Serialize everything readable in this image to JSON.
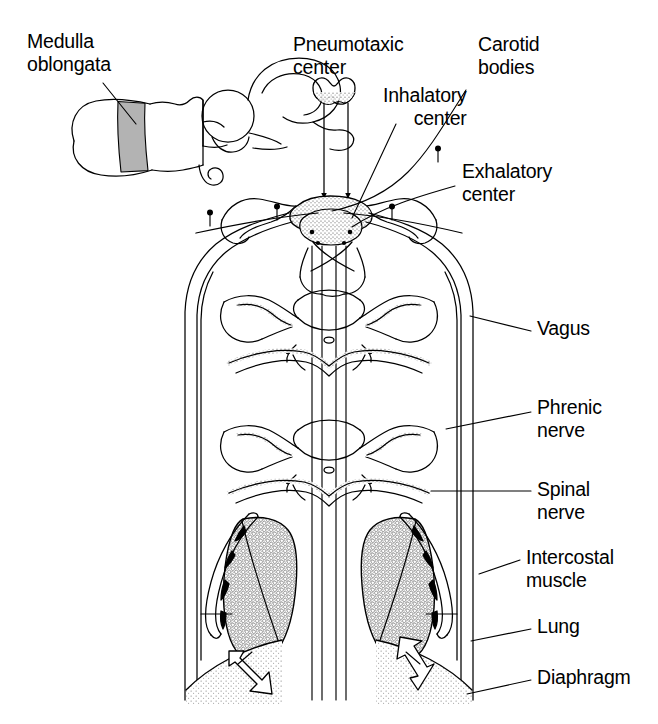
{
  "figure": {
    "background_color": "#ffffff",
    "ink_color": "#000000",
    "shade_color": "#b3b3b3",
    "width": 658,
    "height": 724
  },
  "labels": {
    "medulla_line1": "Medulla",
    "medulla_line2": "oblongata",
    "pneumotaxic_line1": "Pneumotaxic",
    "pneumotaxic_line2": "center",
    "inhalatory_line1": "Inhalatory",
    "inhalatory_line2": "center",
    "carotid_line1": "Carotid",
    "carotid_line2": "bodies",
    "exhalatory_line1": "Exhalatory",
    "exhalatory_line2": "center",
    "vagus": "Vagus",
    "phrenic_line1": "Phrenic",
    "phrenic_line2": "nerve",
    "spinal_line1": "Spinal",
    "spinal_line2": "nerve",
    "intercostal_line1": "Intercostal",
    "intercostal_line2": "muscle",
    "lung": "Lung",
    "diaphragm": "Diaphragm"
  },
  "structures": [
    {
      "name": "brain-inset",
      "description": "sagittal outline of brain and brainstem, medulla segment shaded grey"
    },
    {
      "name": "pneumotaxic-center",
      "description": "bilobed nucleus at top of pons with stippled inferior border"
    },
    {
      "name": "medulla-section",
      "description": "transverse section of medulla with stippled cortical band and stippled inner core"
    },
    {
      "name": "inhalatory-center",
      "description": "respiratory nucleus in dorsal medulla, right of midline"
    },
    {
      "name": "exhalatory-center",
      "description": "respiratory nucleus in ventral medulla"
    },
    {
      "name": "carotid-bodies",
      "description": "four pin markers on the carotid arch band"
    },
    {
      "name": "vertebra-upper",
      "description": "transverse section of vertebra with spinal cord and nerve roots"
    },
    {
      "name": "vertebra-lower",
      "description": "transverse section of vertebra with spinal cord and nerve roots"
    },
    {
      "name": "vagus-nerve",
      "description": "paired nerve trunks descending along the lateral body wall"
    },
    {
      "name": "phrenic-nerve",
      "description": "paired descending tracts to the diaphragm"
    },
    {
      "name": "spinal-nerve",
      "description": "segmental nerve leaving the cord toward intercostal muscle"
    },
    {
      "name": "lung-left",
      "description": "stippled alveolar lung field, left side"
    },
    {
      "name": "lung-right",
      "description": "stippled alveolar lung field, right side"
    },
    {
      "name": "intercostal-muscle",
      "description": "elongated muscle band lateral to each lung"
    },
    {
      "name": "diaphragm",
      "description": "stippled dome beneath the lungs with motion arrows"
    },
    {
      "name": "arrow-diaphragm-left",
      "direction": "down-right",
      "description": "hollow arrow showing descent of diaphragm"
    },
    {
      "name": "arrow-diaphragm-right",
      "direction": "up-left",
      "description": "hollow arrow showing ascent of diaphragm"
    },
    {
      "name": "arrow-pneumotaxic-left",
      "direction": "down",
      "description": "solid arrow from pneumotaxic center to medulla"
    },
    {
      "name": "arrow-pneumotaxic-right",
      "direction": "down",
      "description": "solid arrow from pneumotaxic center to medulla"
    }
  ]
}
